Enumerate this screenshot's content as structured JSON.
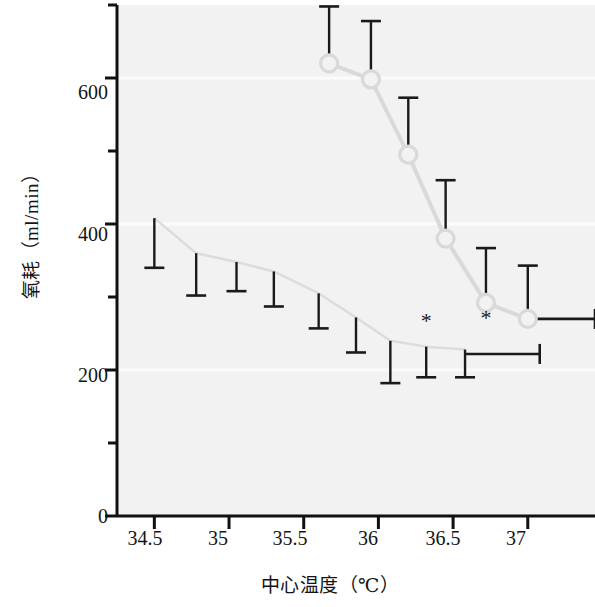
{
  "chart_data": {
    "type": "line",
    "title": "",
    "xlabel": "中心温度（℃）",
    "ylabel": "氧耗（ml/min）",
    "xlim": [
      34.25,
      37.45
    ],
    "ylim": [
      0,
      700
    ],
    "x_ticks": [
      "34.5",
      "35",
      "35.5",
      "36",
      "36.5",
      "37"
    ],
    "x_tick_values": [
      34.5,
      35,
      35.5,
      36,
      36.5,
      37
    ],
    "y_ticks": [
      "0",
      "200",
      "400",
      "600"
    ],
    "y_tick_values": [
      0,
      200,
      400,
      600
    ],
    "y_minor_ticks": [
      100,
      300,
      500,
      700
    ],
    "grid": false,
    "legend": "none",
    "series": [
      {
        "name": "upper-series",
        "marker": "open-circle",
        "color": "#d9d9d9",
        "error_direction": "up",
        "points": [
          {
            "x": 35.67,
            "y": 620,
            "err_up": 78,
            "err_down": 0
          },
          {
            "x": 35.95,
            "y": 598,
            "err_up": 80,
            "err_down": 0
          },
          {
            "x": 36.2,
            "y": 495,
            "err_up": 78,
            "err_down": 0
          },
          {
            "x": 36.45,
            "y": 380,
            "err_up": 80,
            "err_down": 0
          },
          {
            "x": 36.72,
            "y": 292,
            "err_up": 75,
            "err_down": 0
          },
          {
            "x": 37.0,
            "y": 270,
            "err_up": 73,
            "err_down": 0
          }
        ]
      },
      {
        "name": "lower-series",
        "marker": "none",
        "color": "#dcdcdc",
        "error_direction": "down",
        "points": [
          {
            "x": 34.5,
            "y": 408,
            "err_up": 0,
            "err_down": 68
          },
          {
            "x": 34.78,
            "y": 360,
            "err_up": 0,
            "err_down": 58
          },
          {
            "x": 35.05,
            "y": 348,
            "err_up": 0,
            "err_down": 40
          },
          {
            "x": 35.3,
            "y": 335,
            "err_up": 0,
            "err_down": 48
          },
          {
            "x": 35.6,
            "y": 305,
            "err_up": 0,
            "err_down": 48
          },
          {
            "x": 35.85,
            "y": 272,
            "err_up": 0,
            "err_down": 48
          },
          {
            "x": 36.08,
            "y": 240,
            "err_up": 0,
            "err_down": 58
          },
          {
            "x": 36.32,
            "y": 232,
            "err_up": 0,
            "err_down": 42
          },
          {
            "x": 36.58,
            "y": 228,
            "err_up": 0,
            "err_down": 38
          }
        ]
      }
    ],
    "annotations": [
      {
        "label": "*",
        "x": 36.32,
        "y": 258
      },
      {
        "label": "*",
        "x": 36.72,
        "y": 262
      }
    ],
    "reference_bars": [
      {
        "name": "upper-reference-bar",
        "x_start": 37.0,
        "x_end": 37.45,
        "y": 270
      },
      {
        "name": "lower-reference-bar",
        "x_start": 36.58,
        "x_end": 37.08,
        "y": 222
      }
    ]
  }
}
